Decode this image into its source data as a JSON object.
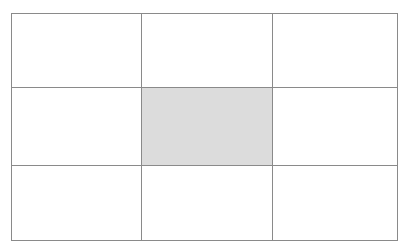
{
  "figure": {
    "kind": "grid-diagram",
    "title": "",
    "background_color": "#ffffff",
    "line_color": "#8a8a8a",
    "line_width_px": 1,
    "fill_color": "#dcdcdc",
    "cell_background_color": "#ffffff",
    "geometry": {
      "canvas_width_px": 410,
      "canvas_height_px": 252,
      "grid_left_px": 11,
      "grid_top_px": 13,
      "grid_width_px": 386,
      "grid_height_px": 227,
      "rows": 3,
      "columns": 3,
      "column_widths_px": [
        130,
        131,
        125
      ],
      "row_heights_px": [
        74,
        78,
        75
      ],
      "vertical_divider_x_px": [
        141,
        272
      ],
      "horizontal_divider_y_px": [
        87,
        165
      ]
    },
    "highlighted_cell": {
      "row_index": 1,
      "column_index": 1,
      "position_label": "center",
      "left_px": 141,
      "top_px": 87,
      "width_px": 131,
      "height_px": 78
    },
    "cells": [
      [
        {
          "label": "",
          "filled": false
        },
        {
          "label": "",
          "filled": false
        },
        {
          "label": "",
          "filled": false
        }
      ],
      [
        {
          "label": "",
          "filled": false
        },
        {
          "label": "",
          "filled": true
        },
        {
          "label": "",
          "filled": false
        }
      ],
      [
        {
          "label": "",
          "filled": false
        },
        {
          "label": "",
          "filled": false
        },
        {
          "label": "",
          "filled": false
        }
      ]
    ]
  }
}
